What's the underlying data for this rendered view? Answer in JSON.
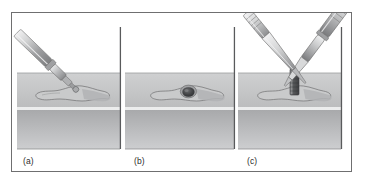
{
  "figure": {
    "kind": "diagram",
    "border_color": "#6f6f70",
    "background_color": "#ffffff"
  },
  "palette": {
    "outline": "#6f6f70",
    "soft_tissue_top": "#cfd0d1",
    "soft_tissue_bottom": "#bcbdbe",
    "bone_band_top": "#a8a9ab",
    "bone_band_bottom": "#cdced0",
    "highlight_line": "#eceded",
    "instrument_light": "#e3e4e5",
    "instrument_mid": "#b9babc",
    "instrument_dark": "#8d8e90",
    "instrument_shadow": "#6a6b6d",
    "implant_body": "#6e6f71",
    "implant_dark": "#3f4042",
    "cavity_dark": "#3b3c3e",
    "flap_fill": "#c9cacb",
    "flap_shadow": "#b2b3b5",
    "divider": "#595a5c",
    "caption_text": "#2b2b2b"
  },
  "geometry": {
    "ground_line_y": 72,
    "band_split_y": 106,
    "band_bottom_y": 148
  },
  "panels": [
    {
      "id": "a",
      "caption": "(a)",
      "step_label": "drilling the osteotomy",
      "instruments": [
        {
          "name": "drill-handpiece",
          "orientation": "upper-right to lower-left",
          "tip": "round bur"
        }
      ],
      "features": [
        {
          "name": "mucosal-flap-outline"
        },
        {
          "name": "entry-point"
        }
      ]
    },
    {
      "id": "b",
      "caption": "(b)",
      "step_label": "prepared cavity",
      "instruments": [],
      "features": [
        {
          "name": "mucosal-flap-outline"
        },
        {
          "name": "osteotomy-hole"
        }
      ]
    },
    {
      "id": "c",
      "caption": "(c)",
      "step_label": "implant insertion",
      "instruments": [
        {
          "name": "left-instrument-forceps",
          "orientation": "upper-left to lower-right",
          "tip": "blade"
        },
        {
          "name": "right-instrument-driver",
          "orientation": "upper-right to lower-left",
          "tip": "tapered tip"
        }
      ],
      "features": [
        {
          "name": "mucosal-flap-outline"
        },
        {
          "name": "implant-post"
        }
      ]
    }
  ]
}
